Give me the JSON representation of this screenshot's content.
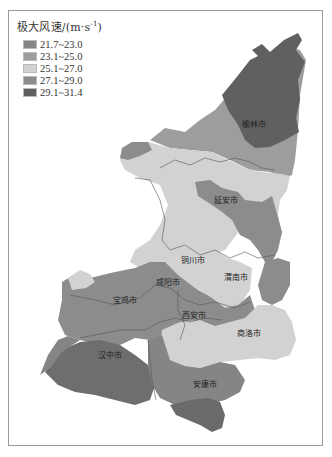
{
  "legend": {
    "title_main": "极大风速/(m·s",
    "title_sup": "-1",
    "title_end": ")",
    "items": [
      {
        "label": "21.7~23.0",
        "color": "#858585"
      },
      {
        "label": "23.1~25.0",
        "color": "#9d9d9d"
      },
      {
        "label": "25.1~27.0",
        "color": "#d2d2d2"
      },
      {
        "label": "27.1~29.0",
        "color": "#8c8c8c"
      },
      {
        "label": "29.1~31.4",
        "color": "#606060"
      }
    ]
  },
  "cities": [
    {
      "name": "榆林市",
      "x": 242,
      "y": 127
    },
    {
      "name": "延安市",
      "x": 214,
      "y": 203
    },
    {
      "name": "铜川市",
      "x": 181,
      "y": 263
    },
    {
      "name": "渭南市",
      "x": 224,
      "y": 280
    },
    {
      "name": "咸阳市",
      "x": 156,
      "y": 285
    },
    {
      "name": "宝鸡市",
      "x": 113,
      "y": 303
    },
    {
      "name": "西安市",
      "x": 182,
      "y": 318
    },
    {
      "name": "商洛市",
      "x": 237,
      "y": 336
    },
    {
      "name": "汉中市",
      "x": 98,
      "y": 358
    },
    {
      "name": "安康市",
      "x": 193,
      "y": 387
    }
  ]
}
